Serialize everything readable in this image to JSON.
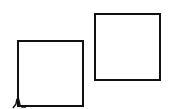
{
  "diagram": {
    "shapes": [
      {
        "id": "square-left",
        "type": "square",
        "x": 17,
        "y": 40,
        "width": 67,
        "height": 67,
        "stroke": "#111111"
      },
      {
        "id": "square-right",
        "type": "square",
        "x": 94,
        "y": 13,
        "width": 67,
        "height": 68,
        "stroke": "#111111"
      }
    ],
    "marks": [
      {
        "id": "corner-mark",
        "icon": "spike-mark-icon",
        "x": 12,
        "y": 95
      }
    ]
  },
  "colors": {
    "background": "#ffffff",
    "stroke": "#111111"
  }
}
